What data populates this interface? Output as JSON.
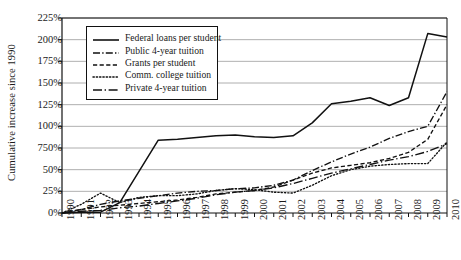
{
  "chart_data": {
    "type": "line",
    "title": "",
    "xlabel": "",
    "ylabel": "Cumulative increase since 1990",
    "x": [
      1990,
      1991,
      1992,
      1993,
      1994,
      1995,
      1996,
      1997,
      1998,
      1999,
      2000,
      2001,
      2002,
      2003,
      2004,
      2005,
      2006,
      2007,
      2008,
      2009,
      2010
    ],
    "xtick_labels": [
      "1990",
      "1991",
      "1992",
      "1993",
      "1994",
      "1995",
      "1996",
      "1997",
      "1998",
      "1999",
      "2000",
      "2001",
      "2002",
      "2003",
      "2004",
      "2005",
      "2006",
      "2007",
      "2008",
      "2009",
      "2010"
    ],
    "ytick_labels": [
      "225%",
      "200%",
      "175%",
      "150%",
      "125%",
      "100%",
      "750%",
      "50%",
      "25%",
      "0%"
    ],
    "ytick_values": [
      225,
      200,
      175,
      150,
      125,
      100,
      75,
      50,
      25,
      0
    ],
    "ylim": [
      0,
      225
    ],
    "xlim": [
      1990,
      2010
    ],
    "grid": "horizontal",
    "legend_position": "upper-left-inside",
    "series": [
      {
        "name": "Federal loans per student",
        "style": "solid",
        "values": [
          0,
          1,
          1,
          12,
          48,
          84,
          85,
          87,
          89,
          90,
          88,
          87,
          89,
          104,
          126,
          129,
          133,
          124,
          133,
          207,
          203
        ]
      },
      {
        "name": "Public 4-year tuition",
        "style": "dash-dot",
        "values": [
          0,
          4,
          10,
          14,
          17,
          20,
          23,
          25,
          26,
          28,
          29,
          32,
          38,
          49,
          59,
          68,
          76,
          86,
          94,
          100,
          140
        ]
      },
      {
        "name": "Grants per student",
        "style": "dashed",
        "values": [
          0,
          4,
          7,
          9,
          11,
          13,
          15,
          18,
          22,
          24,
          26,
          30,
          38,
          46,
          52,
          55,
          58,
          63,
          70,
          85,
          125
        ]
      },
      {
        "name": "Comm. college tuition",
        "style": "dotted",
        "values": [
          0,
          10,
          23,
          12,
          18,
          20,
          20,
          22,
          26,
          28,
          27,
          24,
          23,
          32,
          43,
          50,
          54,
          56,
          57,
          57,
          82
        ]
      },
      {
        "name": "Private 4-year tuition",
        "style": "long-dash-dot",
        "values": [
          0,
          2,
          3,
          6,
          8,
          11,
          14,
          17,
          21,
          24,
          26,
          29,
          34,
          40,
          46,
          51,
          56,
          61,
          65,
          71,
          80
        ]
      }
    ]
  },
  "legend": {
    "items": [
      {
        "label": "Federal loans per student",
        "style": "solid"
      },
      {
        "label": "Public 4-year tuition",
        "style": "dash-dot"
      },
      {
        "label": "Grants per student",
        "style": "dashed"
      },
      {
        "label": "Comm. college tuition",
        "style": "dotted"
      },
      {
        "label": "Private 4-year tuition",
        "style": "long-dash-dot"
      }
    ]
  },
  "axes": {
    "y_title": "Cumulative increase since 1990"
  },
  "colors": {
    "line": "#111111",
    "grid": "#9a9a9a",
    "axis": "#111111",
    "background": "#ffffff"
  }
}
